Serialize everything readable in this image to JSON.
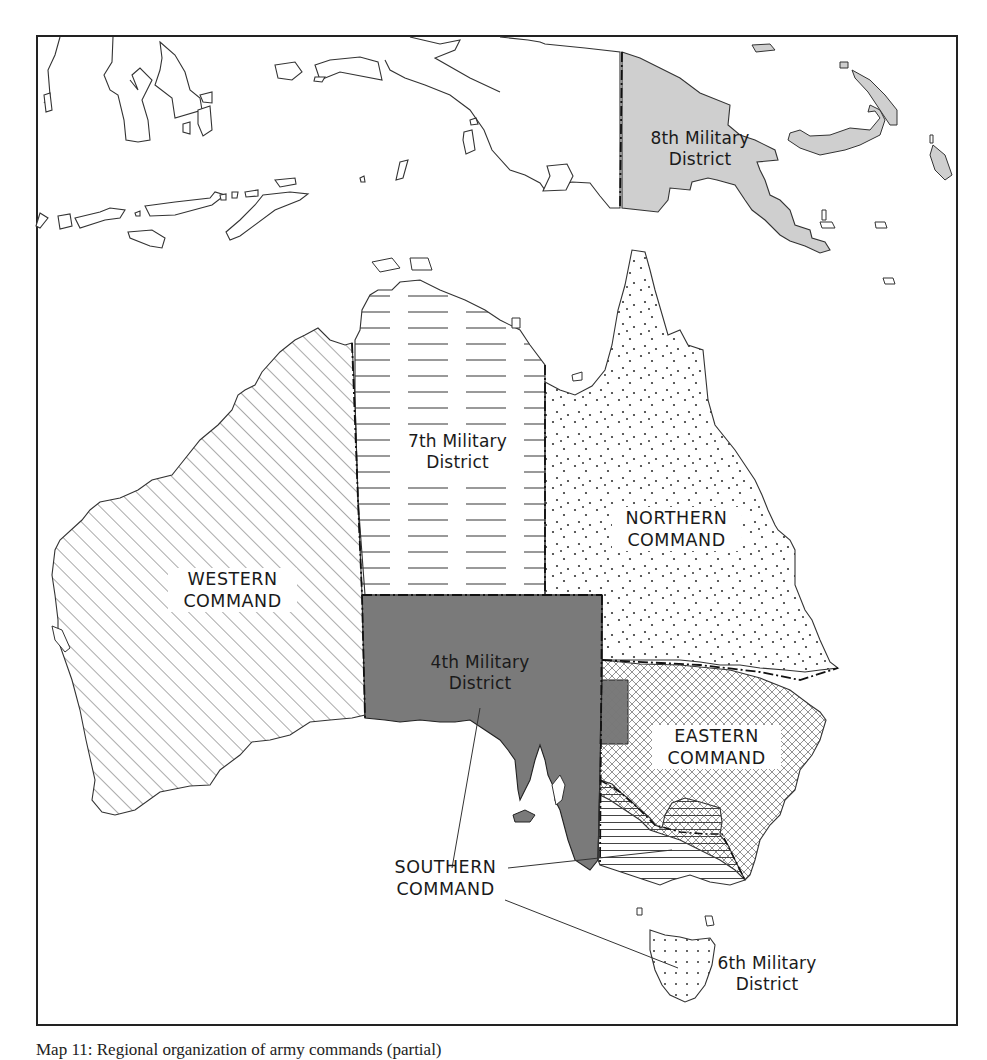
{
  "map": {
    "title": "Map 11: Regional organization of army commands (partial)",
    "caption_visible_text": "Map 11: Regional organization of army commands (partial)",
    "colors": {
      "background": "#ffffff",
      "frame": "#222222",
      "coastline": "#333333",
      "eighth_district_fill": "#cfcfcf",
      "fourth_district_fill": "#7a7a7a",
      "hatch": "#555555",
      "label_text": "#1a1a1a"
    },
    "regions": [
      {
        "id": "western-command",
        "label": "WESTERN\nCOMMAND",
        "pattern": "diagonal-hatch"
      },
      {
        "id": "seventh-military-district",
        "label": "7th Military\nDistrict",
        "pattern": "horizontal-dashes"
      },
      {
        "id": "northern-command",
        "label": "NORTHERN\nCOMMAND",
        "pattern": "stipple-dots"
      },
      {
        "id": "fourth-military-district",
        "label": "4th Military\nDistrict",
        "pattern": "dark-grey-fill"
      },
      {
        "id": "eastern-command",
        "label": "EASTERN\nCOMMAND",
        "pattern": "cross-hatch"
      },
      {
        "id": "southern-command",
        "label": "SOUTHERN\nCOMMAND",
        "pattern": "horizontal-lines"
      },
      {
        "id": "sixth-military-district",
        "label": "6th Military\nDistrict",
        "pattern": "sparse-dots"
      },
      {
        "id": "eighth-military-district",
        "label": "8th Military\nDistrict",
        "pattern": "light-grey-fill"
      }
    ],
    "labels": {
      "eighth": "8th Military\nDistrict",
      "seventh": "7th Military\nDistrict",
      "northern": "NORTHERN\nCOMMAND",
      "western": "WESTERN\nCOMMAND",
      "fourth": "4th Military\nDistrict",
      "eastern": "EASTERN\nCOMMAND",
      "southern": "SOUTHERN\nCOMMAND",
      "sixth": "6th Military\nDistrict"
    },
    "boundary_style": "dash-dot"
  }
}
